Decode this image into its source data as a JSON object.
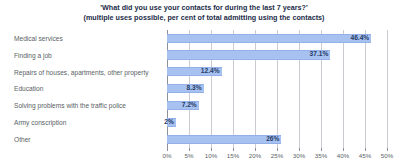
{
  "chart_data": {
    "type": "bar",
    "orientation": "horizontal",
    "title": "'What did you use your contacts for during the last 7 years?'",
    "subtitle": "(multiple uses possible, per cent of total admitting using the contacts)",
    "xlabel": "",
    "ylabel": "",
    "xlim": [
      0,
      50
    ],
    "grid": true,
    "legend": false,
    "categories": [
      "Medical services",
      "Finding a job",
      "Repairs of houses, apartments, other property",
      "Education",
      "Solving problems with the traffic police",
      "Army conscription",
      "Other"
    ],
    "values": [
      46.4,
      37.1,
      12.4,
      8.3,
      7.2,
      2,
      26
    ],
    "value_labels": [
      "46.4%",
      "37.1%",
      "12.4%",
      "8.3%",
      "7.2%",
      "2%",
      "26%"
    ],
    "xticks": [
      0,
      5,
      10,
      15,
      20,
      25,
      30,
      35,
      40,
      45,
      50
    ],
    "xtick_labels": [
      "0%",
      "5%",
      "10%",
      "15%",
      "20%",
      "25%",
      "30%",
      "35%",
      "40%",
      "45%",
      "50%"
    ],
    "colors": {
      "bar_fill": "#a7c1f0",
      "bar_edge": "#93b1e8",
      "value_text": "#1f3a66",
      "category_text": "#5a5f66",
      "title_text": "#1a2b47",
      "gridline": "#c9ccd1",
      "axis": "#8d9197",
      "background": "#ffffff"
    }
  }
}
